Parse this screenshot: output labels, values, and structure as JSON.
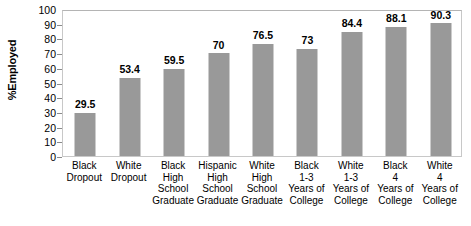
{
  "chart_data": {
    "type": "bar",
    "title": "",
    "xlabel": "",
    "ylabel": "%Employed",
    "ylim": [
      0,
      100
    ],
    "ytick_step": 10,
    "yticks": [
      0,
      10,
      20,
      30,
      40,
      50,
      60,
      70,
      80,
      90,
      100
    ],
    "grid": false,
    "legend": null,
    "bar_color": "#999999",
    "frame_color": "#c8c8c8",
    "categories": [
      "Black\nDropout",
      "White\nDropout",
      "Black High\nSchool\nGraduate",
      "Hispanic\nHigh\nSchool\nGraduate",
      "White\nHigh\nSchool\nGraduate",
      "Black\n1-3\nYears of\nCollege",
      "White\n1-3\nYears of\nCollege",
      "Black\n4\nYears of\nCollege",
      "White\n4\nYears of\nCollege"
    ],
    "values": [
      29.5,
      53.4,
      59.5,
      70,
      76.5,
      73,
      84.4,
      88.1,
      90.3
    ],
    "value_labels": [
      "29.5",
      "53.4",
      "59.5",
      "70",
      "76.5",
      "73",
      "84.4",
      "88.1",
      "90.3"
    ]
  }
}
